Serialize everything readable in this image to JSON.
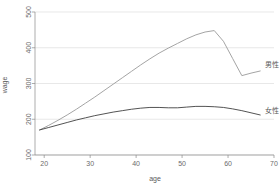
{
  "chart_data": {
    "type": "line",
    "title": "",
    "xlabel": "age",
    "ylabel": "wage",
    "xlim": [
      18,
      70
    ],
    "ylim": [
      100,
      500
    ],
    "grid": true,
    "legend_position": "inline-right",
    "x_ticks": [
      "20",
      "30",
      "40",
      "50",
      "60",
      "70"
    ],
    "x_tick_values": [
      20,
      30,
      40,
      50,
      60,
      70
    ],
    "y_ticks": [
      "100",
      "200",
      "300",
      "400",
      "500"
    ],
    "y_tick_values": [
      100,
      200,
      300,
      400,
      500
    ],
    "series": [
      {
        "name": "男性",
        "color": "#9a9a9a",
        "label_x": 67.5,
        "label_y": 352,
        "x": [
          19,
          21,
          23,
          25,
          27,
          29,
          31,
          33,
          35,
          37,
          39,
          41,
          43,
          45,
          47,
          49,
          51,
          53,
          55,
          57,
          59,
          61,
          63,
          65,
          67
        ],
        "values": [
          170,
          183,
          197,
          212,
          228,
          245,
          262,
          280,
          298,
          316,
          334,
          352,
          369,
          385,
          399,
          412,
          425,
          436,
          444,
          448,
          418,
          370,
          322,
          329,
          335
        ]
      },
      {
        "name": "女性",
        "color": "#404040",
        "label_x": 67.5,
        "label_y": 224,
        "x": [
          19,
          21,
          23,
          25,
          27,
          29,
          31,
          33,
          35,
          37,
          39,
          41,
          43,
          45,
          47,
          49,
          51,
          53,
          55,
          57,
          59,
          61,
          63,
          65,
          67
        ],
        "values": [
          170,
          177,
          184,
          191,
          198,
          204,
          210,
          215,
          220,
          224,
          228,
          231,
          233,
          233,
          232,
          232,
          234,
          236,
          236,
          235,
          233,
          229,
          224,
          218,
          212
        ]
      }
    ]
  },
  "axes": {
    "x_title": "age",
    "y_title": "wage"
  }
}
